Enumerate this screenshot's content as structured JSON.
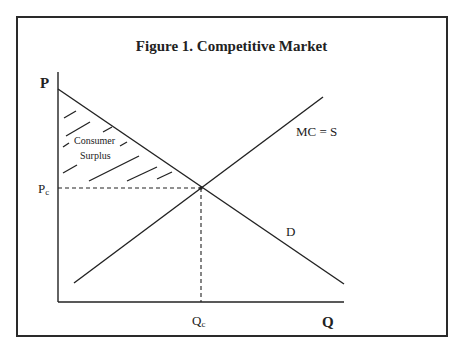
{
  "figure": {
    "title": "Figure 1. Competitive Market"
  },
  "axes": {
    "y_label": "P",
    "x_label": "Q",
    "price_marker": "P",
    "price_marker_sub": "c",
    "quantity_marker": "Q",
    "quantity_marker_sub": "c"
  },
  "curves": {
    "supply_label": "MC = S",
    "demand_label": "D"
  },
  "region": {
    "label_line1": "Consumer",
    "label_line2": "Surplus"
  },
  "colors": {
    "ink": "#222222",
    "background": "#ffffff"
  }
}
